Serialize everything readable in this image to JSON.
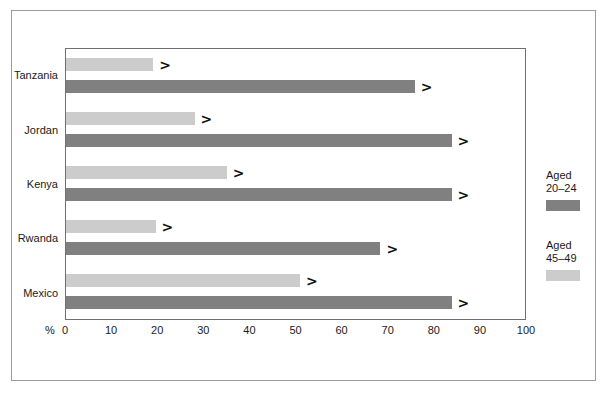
{
  "chart_data": {
    "type": "bar",
    "orientation": "horizontal",
    "title": "",
    "xlabel": "%",
    "ylabel": "",
    "xlim": [
      0,
      100
    ],
    "xticks": [
      "0",
      "10",
      "20",
      "30",
      "40",
      "50",
      "60",
      "70",
      "80",
      "90",
      "100"
    ],
    "xtick_values": [
      0,
      10,
      20,
      30,
      40,
      50,
      60,
      70,
      80,
      90,
      100
    ],
    "grid": false,
    "legend_position": "right",
    "categories": [
      "Tanzania",
      "Jordan",
      "Kenya",
      "Rwanda",
      "Mexico"
    ],
    "series": [
      {
        "name": "Aged 45–49",
        "color": "#cccccc",
        "values": [
          19,
          28,
          35,
          19.5,
          51
        ]
      },
      {
        "name": "Aged 20–24",
        "color": "#808080",
        "values": [
          76,
          84,
          84,
          68.5,
          84
        ]
      }
    ],
    "value_marker": ">"
  },
  "legend": {
    "entries": [
      {
        "line1": "Aged",
        "line2": "20–24",
        "swatch": "series-young"
      },
      {
        "line1": "Aged",
        "line2": "45–49",
        "swatch": "series-old"
      }
    ]
  },
  "axis": {
    "unit_label": "%"
  },
  "colors": {
    "series_young": "#808080",
    "series_old": "#cccccc",
    "outer_border": "#9a9a9a",
    "plot_border": "#6f6f6f",
    "background": "#ffffff",
    "text": "#1a1a1a"
  }
}
